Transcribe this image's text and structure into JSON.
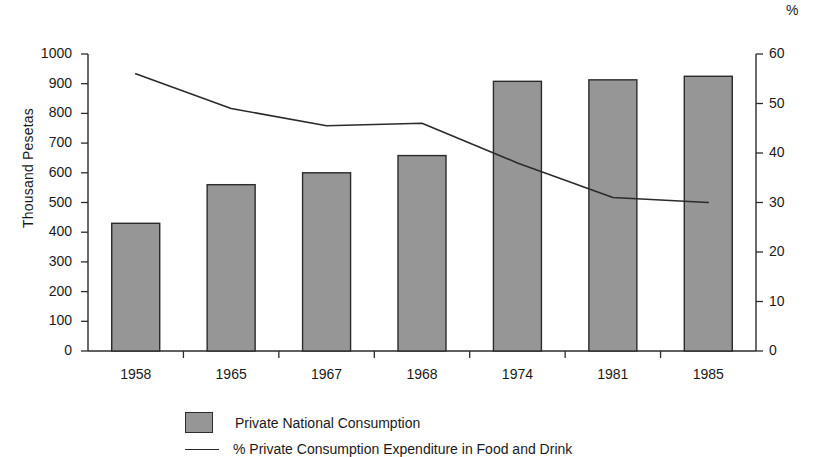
{
  "chart_data": {
    "type": "bar",
    "title": "",
    "subtitle": "",
    "xlabel": "",
    "ylabel": "Thousand Pesetas",
    "y2label": "%",
    "categories": [
      "1958",
      "1965",
      "1967",
      "1968",
      "1974",
      "1981",
      "1985"
    ],
    "ylim": [
      0,
      1000
    ],
    "y2lim": [
      0,
      60
    ],
    "yticks": [
      "0",
      "100",
      "200",
      "300",
      "400",
      "500",
      "600",
      "700",
      "800",
      "900",
      "1000"
    ],
    "ytick_values": [
      0,
      100,
      200,
      300,
      400,
      500,
      600,
      700,
      800,
      900,
      1000
    ],
    "y2ticks": [
      "0",
      "10",
      "20",
      "30",
      "40",
      "50",
      "60"
    ],
    "y2tick_values": [
      0,
      10,
      20,
      30,
      40,
      50,
      60
    ],
    "grid": false,
    "legend_position": "bottom",
    "series": [
      {
        "name": "Private National Consumption",
        "type": "bar",
        "axis": "left",
        "unit": "Thousand Pesetas",
        "color": "#969696",
        "edge_color": "#2b2b2b",
        "values": [
          430,
          560,
          600,
          658,
          908,
          913,
          925
        ]
      },
      {
        "name": "% Private Consumption Expenditure in Food and Drink",
        "type": "line",
        "axis": "right",
        "unit": "%",
        "color": "#2b2b2b",
        "values": [
          56,
          49,
          45.5,
          46,
          38,
          31,
          30
        ]
      }
    ]
  },
  "legend": {
    "items": [
      {
        "label": "Private National Consumption",
        "marker": "bar-swatch"
      },
      {
        "label": "% Private Consumption Expenditure in Food and Drink",
        "marker": "line-swatch"
      }
    ]
  },
  "colors": {
    "bar_fill": "#969696",
    "bar_edge": "#2b2b2b",
    "line": "#2b2b2b",
    "axis": "#2b2b2b",
    "text": "#1a1a1a",
    "background": "#ffffff"
  }
}
